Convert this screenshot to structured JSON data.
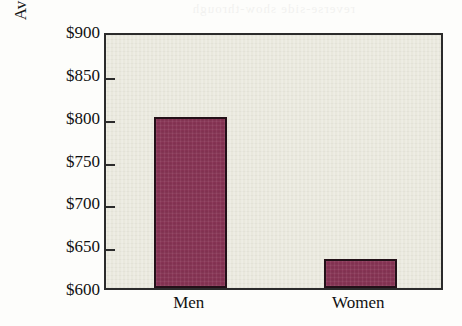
{
  "chart_data": {
    "type": "bar",
    "title": "",
    "subtitle": "",
    "xlabel": "",
    "ylabel": "Average weekly earnings",
    "categories": [
      "Men",
      "Women"
    ],
    "values": [
      800,
      634
    ],
    "ylim": [
      600,
      900
    ],
    "ytick_step": 50,
    "ytick_labels": [
      "$900",
      "$850",
      "$800",
      "$750",
      "$700",
      "$650",
      "$600"
    ],
    "ytick_values": [
      900,
      850,
      800,
      750,
      700,
      650,
      600
    ],
    "grid": false,
    "legend": null,
    "annotations": [],
    "series": [
      {
        "name": "Average weekly earnings",
        "values": [
          800,
          634
        ]
      }
    ]
  },
  "style": {
    "bar_color": "#8a3556",
    "bar_outline_color": "#231018",
    "plot_background": "#e9e8dd",
    "page_background": "#fdfdfb",
    "axis_color": "#2b2b2b",
    "text_color": "#111111"
  },
  "artifacts": {
    "bleed_through_text": "reverse-side show-through"
  }
}
